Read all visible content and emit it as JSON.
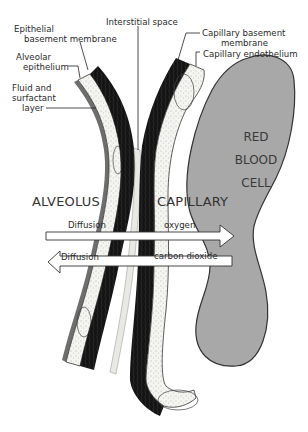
{
  "labels": {
    "epithelial_basement_membrane": [
      "Epithelial",
      "basement membrane"
    ],
    "alveolar_epithelium": [
      "Alveolar",
      "epithelium"
    ],
    "fluid_surfactant_layer": [
      "Fluid and",
      "surfactant",
      "layer"
    ],
    "interstitial_space": "Interstitial space",
    "capillary_basement_membrane": [
      "Capillary basement",
      "membrane"
    ],
    "capillary_endothelium": "Capillary endothelium"
  },
  "regions": {
    "alveolus": "ALVEOLUS",
    "capillary": "CAPILLARY",
    "red_blood_cell": [
      "RED",
      "BLOOD",
      "CELL"
    ]
  },
  "arrows": [
    {
      "direction": "right",
      "left_label": "Diffusion",
      "right_label": "oxygen"
    },
    {
      "direction": "left",
      "left_label": "Diffusion",
      "right_label": "carbon dioxide"
    }
  ],
  "colors": {
    "membrane_dark": "#1a1a1a",
    "stipple_light": "#f2f2ee",
    "rbc_fill": "#a8a8a8",
    "arrow_fill": "#ffffff",
    "line": "#222222"
  }
}
